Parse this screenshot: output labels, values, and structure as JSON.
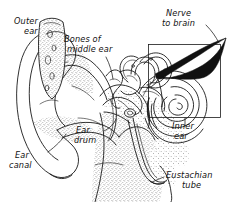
{
  "diagram": {
    "style": "hand-drawn pen-and-ink anatomical illustration",
    "background_color": "#ffffff",
    "ink_color": "#1a1a1a",
    "width": 229,
    "height": 202,
    "labels": [
      {
        "id": "outer-ear",
        "line1": "Outer",
        "line2": "ear",
        "x": 14,
        "y": 24,
        "indent2": 10
      },
      {
        "id": "bones-of-middle-ear",
        "line1": "Bones of",
        "line2": "middle ear",
        "x": 64,
        "y": 42,
        "indent2": 3
      },
      {
        "id": "nerve-to-brain",
        "line1": "Nerve",
        "line2": "to brain",
        "x": 166,
        "y": 16,
        "indent2": -4
      },
      {
        "id": "inner-ear",
        "line1": "Inner",
        "line2": "ear",
        "x": 172,
        "y": 129,
        "indent2": 2
      },
      {
        "id": "ear-drum",
        "line1": "Ear",
        "line2": "drum",
        "x": 76,
        "y": 133,
        "indent2": -2
      },
      {
        "id": "ear-canal",
        "line1": "Ear",
        "line2": "canal",
        "x": 15,
        "y": 158,
        "indent2": -6
      },
      {
        "id": "eustachian-tube",
        "line1": "Eustachian",
        "line2": "tube",
        "x": 166,
        "y": 178,
        "indent2": 16
      }
    ],
    "parts": [
      "pinna",
      "ear canal",
      "ear drum",
      "ossicles",
      "cochlea",
      "semicircular canals",
      "auditory nerve",
      "eustachian tube"
    ],
    "inner_ear_box": {
      "x": 148,
      "y": 44,
      "width": 73,
      "height": 74
    }
  }
}
